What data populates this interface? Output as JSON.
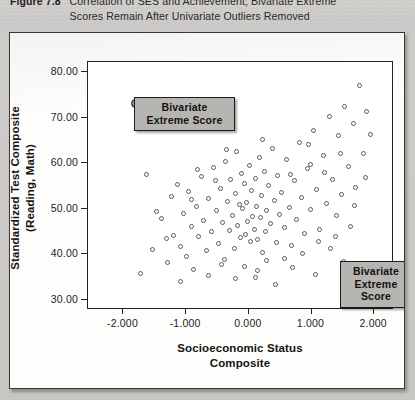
{
  "caption": {
    "label": "Figure 7.8",
    "text": "Correlation of SES and Achievement; Bivariate Extreme Scores Remain After Univariate Outliers Removed"
  },
  "annotations": [
    {
      "id": "callout-top",
      "text": "Bivariate\nExtreme Score"
    },
    {
      "id": "callout-bottom",
      "text": "Bivariate\nExtreme\nScore"
    }
  ],
  "chart_data": {
    "type": "scatter",
    "title": "Correlation of SES and Achievement; Bivariate Extreme Scores Remain After Univariate Outliers Removed",
    "xlabel": "Socioeconomic Status Composite",
    "ylabel": "Standardized Test Composite (Reading, Math)",
    "xlim": [
      -2.55,
      2.3
    ],
    "ylim": [
      28.0,
      82.0
    ],
    "xticks": [
      -2.0,
      -1.0,
      0.0,
      1.0,
      2.0
    ],
    "xticklabels": [
      "-2.000",
      "-1.000",
      "0.000",
      "1.000",
      "2.000"
    ],
    "yticks": [
      30.0,
      40.0,
      50.0,
      60.0,
      70.0,
      80.0
    ],
    "yticklabels": [
      "30.00",
      "40.00",
      "50.00",
      "60.00",
      "70.00",
      "80.00"
    ],
    "grid": false,
    "legend": false,
    "marker": "open-circle",
    "series": [
      {
        "name": "Students",
        "marker": "open-circle",
        "points": [
          [
            -1.62,
            57.3
          ],
          [
            -1.45,
            49.1
          ],
          [
            -1.38,
            47.6
          ],
          [
            -1.3,
            43.2
          ],
          [
            -1.22,
            52.4
          ],
          [
            -1.19,
            44.0
          ],
          [
            -1.12,
            55.2
          ],
          [
            -1.08,
            41.5
          ],
          [
            -1.02,
            48.8
          ],
          [
            -0.98,
            39.2
          ],
          [
            -0.95,
            53.6
          ],
          [
            -0.9,
            45.9
          ],
          [
            -0.86,
            36.4
          ],
          [
            -0.82,
            50.3
          ],
          [
            -0.78,
            43.8
          ],
          [
            -0.74,
            56.8
          ],
          [
            -0.7,
            47.2
          ],
          [
            -0.66,
            40.6
          ],
          [
            -0.62,
            52.0
          ],
          [
            -0.58,
            44.7
          ],
          [
            -0.54,
            58.9
          ],
          [
            -0.5,
            49.5
          ],
          [
            -0.47,
            42.1
          ],
          [
            -0.44,
            54.3
          ],
          [
            -0.41,
            46.8
          ],
          [
            -0.38,
            38.7
          ],
          [
            -0.35,
            60.2
          ],
          [
            -0.32,
            51.4
          ],
          [
            -0.3,
            45.0
          ],
          [
            -0.27,
            56.1
          ],
          [
            -0.25,
            48.3
          ],
          [
            -0.22,
            41.0
          ],
          [
            -0.2,
            53.2
          ],
          [
            -0.18,
            62.4
          ],
          [
            -0.16,
            46.2
          ],
          [
            -0.14,
            50.8
          ],
          [
            -0.12,
            43.5
          ],
          [
            -0.1,
            57.6
          ],
          [
            -0.08,
            49.9
          ],
          [
            -0.06,
            55.4
          ],
          [
            -0.04,
            44.2
          ],
          [
            -0.02,
            51.1
          ],
          [
            0.0,
            47.0
          ],
          [
            0.02,
            59.3
          ],
          [
            0.04,
            42.6
          ],
          [
            0.06,
            53.9
          ],
          [
            0.08,
            48.0
          ],
          [
            0.1,
            45.3
          ],
          [
            0.12,
            56.5
          ],
          [
            0.14,
            50.2
          ],
          [
            0.16,
            43.0
          ],
          [
            0.18,
            61.0
          ],
          [
            0.2,
            47.8
          ],
          [
            0.22,
            52.7
          ],
          [
            0.24,
            40.2
          ],
          [
            0.26,
            58.0
          ],
          [
            0.28,
            44.9
          ],
          [
            0.3,
            49.3
          ],
          [
            0.33,
            54.8
          ],
          [
            0.36,
            46.5
          ],
          [
            0.39,
            63.1
          ],
          [
            0.42,
            51.6
          ],
          [
            0.45,
            42.3
          ],
          [
            0.48,
            57.1
          ],
          [
            0.51,
            48.6
          ],
          [
            0.54,
            53.4
          ],
          [
            0.58,
            45.6
          ],
          [
            0.62,
            60.7
          ],
          [
            0.66,
            50.0
          ],
          [
            0.7,
            41.8
          ],
          [
            0.74,
            55.9
          ],
          [
            0.78,
            47.4
          ],
          [
            0.82,
            64.3
          ],
          [
            0.86,
            52.2
          ],
          [
            0.9,
            44.4
          ],
          [
            0.95,
            58.6
          ],
          [
            1.0,
            49.7
          ],
          [
            1.05,
            67.0
          ],
          [
            1.1,
            54.0
          ],
          [
            1.15,
            45.2
          ],
          [
            1.2,
            61.5
          ],
          [
            1.25,
            51.0
          ],
          [
            1.3,
            70.1
          ],
          [
            1.35,
            56.3
          ],
          [
            1.4,
            43.6
          ],
          [
            1.45,
            65.8
          ],
          [
            1.5,
            52.9
          ],
          [
            1.55,
            72.3
          ],
          [
            1.6,
            59.0
          ],
          [
            1.64,
            46.0
          ],
          [
            1.68,
            68.4
          ],
          [
            1.72,
            54.5
          ],
          [
            1.78,
            76.8
          ],
          [
            1.84,
            62.0
          ],
          [
            1.9,
            71.2
          ],
          [
            1.95,
            66.1
          ],
          [
            -1.72,
            35.6
          ],
          [
            -1.52,
            40.8
          ],
          [
            -1.08,
            33.8
          ],
          [
            -0.62,
            35.1
          ],
          [
            -0.2,
            34.4
          ],
          [
            0.16,
            36.2
          ],
          [
            0.44,
            33.2
          ],
          [
            0.72,
            37.0
          ],
          [
            1.08,
            35.4
          ],
          [
            1.32,
            41.1
          ],
          [
            1.52,
            38.2
          ],
          [
            0.3,
            38.4
          ],
          [
            -0.42,
            37.5
          ],
          [
            -0.8,
            58.4
          ],
          [
            0.58,
            38.8
          ],
          [
            0.88,
            40.0
          ],
          [
            1.12,
            42.5
          ],
          [
            1.42,
            48.2
          ],
          [
            1.7,
            50.4
          ],
          [
            1.88,
            56.6
          ],
          [
            -1.28,
            38.0
          ],
          [
            -0.06,
            37.2
          ],
          [
            0.12,
            34.8
          ],
          [
            -0.34,
            62.9
          ],
          [
            0.96,
            63.8
          ],
          [
            1.22,
            57.8
          ],
          [
            1.48,
            61.9
          ],
          [
            -0.52,
            56.0
          ],
          [
            0.24,
            64.9
          ],
          [
            0.68,
            57.4
          ],
          [
            1.0,
            59.6
          ],
          [
            -0.9,
            51.8
          ]
        ]
      },
      {
        "name": "Bivariate extreme scores",
        "marker": "filled-circle",
        "points": [
          [
            -1.8,
            73.0
          ],
          [
            1.65,
            31.5
          ]
        ]
      }
    ]
  }
}
